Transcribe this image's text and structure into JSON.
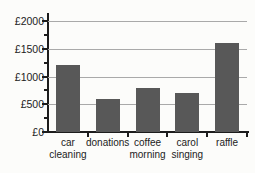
{
  "chart_data": {
    "type": "bar",
    "title": "",
    "xlabel": "",
    "ylabel": "",
    "categories": [
      "car\ncleaning",
      "donations",
      "coffee\nmorning",
      "carol\nsinging",
      "raffle"
    ],
    "values": [
      1200,
      600,
      800,
      700,
      1600
    ],
    "currency": "£",
    "ylim": [
      0,
      2000
    ],
    "y_ticks": [
      {
        "value": 0,
        "label": "£0"
      },
      {
        "value": 500,
        "label": "£500"
      },
      {
        "value": 1000,
        "label": "£1000"
      },
      {
        "value": 1500,
        "label": "£1500"
      },
      {
        "value": 2000,
        "label": "£2000"
      }
    ],
    "y_minor_ticks": [
      250,
      750,
      1250,
      1750
    ],
    "grid": true,
    "legend": "none",
    "bar_color": "#585858",
    "axis_color": "#1c1c1c",
    "gridline_color": "#a9a9a9",
    "text_color": "#222222",
    "background_color": "#fcfcfa"
  }
}
